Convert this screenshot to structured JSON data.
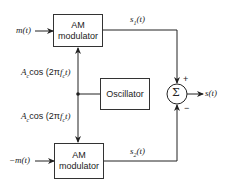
{
  "diagram": {
    "inputs": {
      "top": "m(t)",
      "bottom": "−m(t)"
    },
    "blocks": {
      "top_modulator": {
        "line1": "AM",
        "line2": "modulator"
      },
      "bottom_modulator": {
        "line1": "AM",
        "line2": "modulator"
      },
      "oscillator": {
        "label": "Oscillator"
      },
      "summer": {
        "symbol": "Σ"
      }
    },
    "carrier_labels": {
      "top": "Acos (2πfct)",
      "bottom": "Acos (2πfct)",
      "top_parts": {
        "A": "A",
        "A_sub": "c",
        "cos": "cos (2π",
        "f": "f",
        "f_sub": "c",
        "tail": "t)"
      },
      "bottom_parts": {
        "A": "A",
        "A_sub": "c",
        "cos": "cos (2π",
        "f": "f",
        "f_sub": "c",
        "tail": "t)"
      }
    },
    "signals": {
      "s1": {
        "base": "s",
        "sub": "1",
        "arg": "(t)"
      },
      "s2": {
        "base": "s",
        "sub": "2",
        "arg": "(t)"
      },
      "output": "s(t)"
    },
    "signs": {
      "plus": "+",
      "minus": "−"
    }
  }
}
